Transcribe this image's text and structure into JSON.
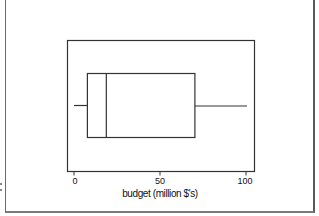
{
  "chart_data": {
    "type": "boxplot",
    "orientation": "horizontal",
    "title": "",
    "xlabel": "budget (million $'s)",
    "ylabel": "",
    "xlim": [
      -3,
      104
    ],
    "xticks": [
      0,
      50,
      100
    ],
    "xtick_labels": [
      "0",
      "50",
      "100"
    ],
    "grid": false,
    "legend": null,
    "series": [
      {
        "name": "budget",
        "min": 0,
        "q1": 7.5,
        "median": 18.5,
        "q3": 70,
        "max": 100
      }
    ],
    "colors": {
      "stroke": "#333333",
      "background": "#ffffff"
    }
  },
  "axis": {
    "ticks": [
      {
        "label": "0"
      },
      {
        "label": "50"
      },
      {
        "label": "100"
      }
    ],
    "xlabel": "budget (million $'s)"
  }
}
